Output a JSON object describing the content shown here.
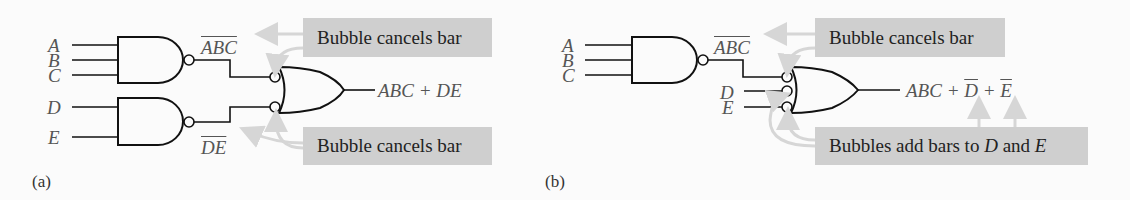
{
  "panel_a": {
    "caption": "(a)",
    "inputs": [
      "A",
      "B",
      "C",
      "D",
      "E"
    ],
    "nand1_output": "ABC",
    "nand2_output": "DE",
    "output_expr": "ABC + DE",
    "callout_top": "Bubble cancels bar",
    "callout_bottom": "Bubble cancels bar"
  },
  "panel_b": {
    "caption": "(b)",
    "inputs": [
      "A",
      "B",
      "C",
      "D",
      "E"
    ],
    "nand1_output": "ABC",
    "output_expr": {
      "prefix": "ABC + ",
      "d": "D",
      "plus": " + ",
      "e": "E"
    },
    "callout_top": "Bubble cancels bar",
    "callout_bottom": {
      "prefix": "Bubbles add bars to ",
      "d": "D",
      "mid": " and ",
      "e": "E"
    }
  },
  "colors": {
    "line": "#111111",
    "callout_bg": "#cfcfcf",
    "arrow": "#d6d6d6",
    "label": "#555555"
  }
}
